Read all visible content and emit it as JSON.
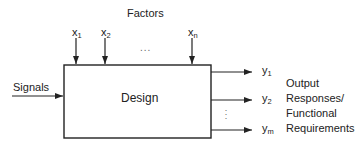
{
  "diagram": {
    "title": "Factors",
    "box_label": "Design",
    "input_label": "Signals",
    "factors": [
      {
        "base": "x",
        "sub": "1"
      },
      {
        "base": "x",
        "sub": "2"
      },
      {
        "base": "x",
        "sub": "n"
      }
    ],
    "factor_ellipsis": "...",
    "outputs": [
      {
        "base": "y",
        "sub": "1"
      },
      {
        "base": "y",
        "sub": "2"
      },
      {
        "base": "y",
        "sub": "m"
      }
    ],
    "output_ellipsis": ":",
    "output_caption_lines": [
      "Output",
      "Responses/",
      "Functional",
      "Requirements"
    ],
    "colors": {
      "stroke": "#222222",
      "background": "#ffffff"
    }
  }
}
